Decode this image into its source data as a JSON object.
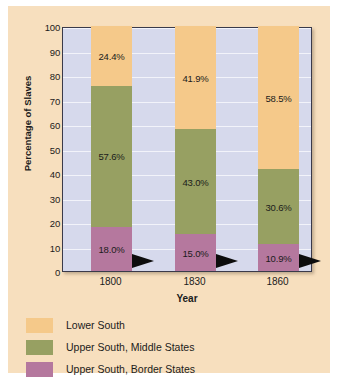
{
  "chart_data": {
    "type": "bar",
    "subtype": "stacked-100-percent",
    "title": "",
    "xlabel": "Year",
    "ylabel": "Percentage of Slaves",
    "categories": [
      "1800",
      "1830",
      "1860"
    ],
    "ylim": [
      0,
      100
    ],
    "yticks": [
      0,
      10,
      20,
      30,
      40,
      50,
      60,
      70,
      80,
      90,
      100
    ],
    "ytick_labels": [
      "0",
      "10",
      "20",
      "30",
      "40",
      "50",
      "60",
      "70",
      "80",
      "90",
      "100"
    ],
    "grid": true,
    "grid_axis": "y",
    "legend_position": "below",
    "series": [
      {
        "name": "Lower South",
        "color": "#f5c98a",
        "values": [
          24.4,
          41.9,
          58.5
        ],
        "labels": [
          "24.4%",
          "41.9%",
          "58.5%"
        ]
      },
      {
        "name": "Upper South, Middle States",
        "color": "#97a062",
        "values": [
          57.6,
          43.0,
          30.6
        ],
        "labels": [
          "57.6%",
          "43.0%",
          "30.6%"
        ]
      },
      {
        "name": "Upper South, Border States",
        "color": "#b5789e",
        "values": [
          18.0,
          15.0,
          10.9
        ],
        "labels": [
          "18.0%",
          "15.0%",
          "10.9%"
        ]
      }
    ]
  },
  "axes": {
    "y_title": "Percentage of Slaves",
    "x_title": "Year",
    "y_ticks": [
      "100",
      "90",
      "80",
      "70",
      "60",
      "50",
      "40",
      "30",
      "20",
      "10",
      "0"
    ],
    "x_ticks": [
      "1800",
      "1830",
      "1860"
    ]
  },
  "legend": {
    "items": [
      {
        "label": "Lower South",
        "color": "#f5c98a"
      },
      {
        "label": "Upper South, Middle States",
        "color": "#97a062"
      },
      {
        "label": "Upper South, Border States",
        "color": "#b5789e"
      }
    ]
  },
  "bars": [
    {
      "category": "1800",
      "segments": [
        {
          "series": "Lower South",
          "value": 24.4,
          "label": "24.4%",
          "color": "#f5c98a"
        },
        {
          "series": "Upper South, Middle States",
          "value": 57.6,
          "label": "57.6%",
          "color": "#97a062"
        },
        {
          "series": "Upper South, Border States",
          "value": 18.0,
          "label": "18.0%",
          "color": "#b5789e"
        }
      ]
    },
    {
      "category": "1830",
      "segments": [
        {
          "series": "Lower South",
          "value": 41.9,
          "label": "41.9%",
          "color": "#f5c98a"
        },
        {
          "series": "Upper South, Middle States",
          "value": 43.0,
          "label": "43.0%",
          "color": "#97a062"
        },
        {
          "series": "Upper South, Border States",
          "value": 15.0,
          "label": "15.0%",
          "color": "#b5789e"
        }
      ]
    },
    {
      "category": "1860",
      "segments": [
        {
          "series": "Lower South",
          "value": 58.5,
          "label": "58.5%",
          "color": "#f5c98a"
        },
        {
          "series": "Upper South, Middle States",
          "value": 30.6,
          "label": "30.6%",
          "color": "#97a062"
        },
        {
          "series": "Upper South, Border States",
          "value": 10.9,
          "label": "10.9%",
          "color": "#b5789e"
        }
      ]
    }
  ],
  "style": {
    "panel_background": "#f7dfbe",
    "plot_background": "#d6d9ec",
    "gridline_color": "#f2f3fa",
    "frame_color": "#3a3a4a",
    "arrow_color": "#0d0d0d",
    "text_color": "#1b1b1b"
  }
}
